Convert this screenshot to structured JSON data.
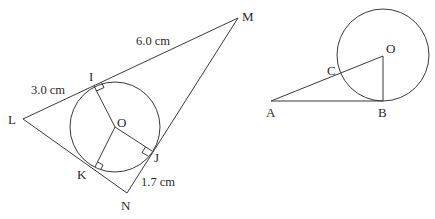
{
  "figure_left": {
    "vertices": {
      "L": "L",
      "M": "M",
      "N": "N"
    },
    "tangent_points": {
      "I": "I",
      "J": "J",
      "K": "K"
    },
    "center": "O",
    "measurements": {
      "LI": "3.0 cm",
      "IM": "6.0 cm",
      "JN": "1.7 cm"
    },
    "right_angle_marks": [
      "I",
      "J",
      "K"
    ]
  },
  "figure_right": {
    "points": {
      "A": "A",
      "B": "B",
      "C": "C",
      "O": "O"
    }
  },
  "colors": {
    "line": "#3a3a3a",
    "text": "#2a2a2a",
    "background": "#ffffff"
  }
}
